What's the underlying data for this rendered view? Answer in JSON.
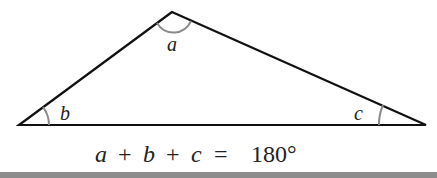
{
  "diagram": {
    "vertices": {
      "top": [
        172,
        12
      ],
      "left": [
        19,
        125
      ],
      "right": [
        426,
        125
      ]
    },
    "angles": [
      {
        "label": "a",
        "vertex": "top"
      },
      {
        "label": "b",
        "vertex": "left"
      },
      {
        "label": "c",
        "vertex": "right"
      }
    ],
    "equation": {
      "parts": [
        "a",
        "+",
        "b",
        "+",
        "c",
        "=",
        "180°"
      ]
    },
    "colors": {
      "line": "#111111",
      "arc": "#8a8a8a",
      "bar": "#8c8c8c"
    }
  }
}
